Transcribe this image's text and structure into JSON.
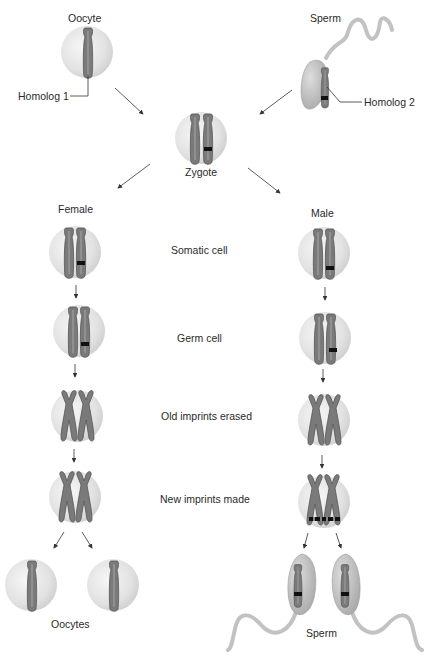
{
  "diagram": {
    "title_nodes": {
      "oocyte": "Oocyte",
      "sperm": "Sperm",
      "zygote": "Zygote",
      "female": "Female",
      "male": "Male",
      "oocytes": "Oocytes",
      "sperm_bottom": "Sperm"
    },
    "callouts": {
      "homolog1": "Homolog 1",
      "homolog2": "Homolog 2"
    },
    "stages": [
      {
        "label": "Somatic cell"
      },
      {
        "label": "Germ cell"
      },
      {
        "label": "Old imprints erased"
      },
      {
        "label": "New imprints made"
      }
    ],
    "colors": {
      "cell_fill": "#e4e4e4",
      "cell_edge": "#c8c8c8",
      "chromosome": "#7a7a7a",
      "chromosome_edge": "#555555",
      "imprint_mark": "#111111",
      "sperm_head": "#bdbdbd",
      "arrow": "#333333"
    }
  }
}
